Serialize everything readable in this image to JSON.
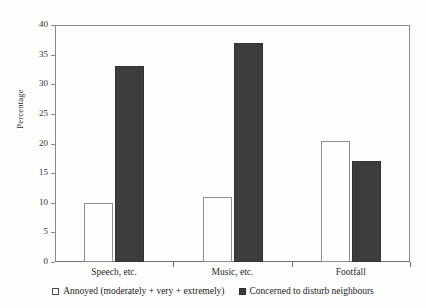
{
  "chart_data": {
    "type": "bar",
    "title": "",
    "xlabel": "",
    "ylabel": "Percentage",
    "ylim": [
      0,
      40
    ],
    "yticks": [
      0,
      5,
      10,
      15,
      20,
      25,
      30,
      35,
      40
    ],
    "ytick_labels": [
      "0",
      "5",
      "10",
      "15",
      "20",
      "25",
      "30",
      "35",
      "40"
    ],
    "grid": false,
    "legend_position": "bottom-outside",
    "categories": [
      "Speech, etc.",
      "Music, etc.",
      "Footfall"
    ],
    "series": [
      {
        "name": "Annoyed (moderately + very + extremely)",
        "style": "open",
        "color": "#fdfdfc",
        "edge_color": "#8d8d8d",
        "values": [
          10,
          11,
          20.5
        ]
      },
      {
        "name": "Concerned to disturb neighbours",
        "style": "filled",
        "color": "#3d3d3d",
        "edge_color": "#333333",
        "values": [
          33,
          37,
          17
        ]
      }
    ],
    "legend_entries": [
      {
        "label": "Annoyed (moderately + very + extremely)",
        "marker": "open-square-swatch"
      },
      {
        "label": "Concerned to disturb neighbours",
        "marker": "filled-square-swatch"
      }
    ]
  },
  "colors": {
    "background": "#fdfdfc",
    "axis": "#8a8a8a",
    "filled_bar": "#3d3d3d",
    "open_bar_edge": "#8d8d8d",
    "text": "#2b2b2b"
  }
}
